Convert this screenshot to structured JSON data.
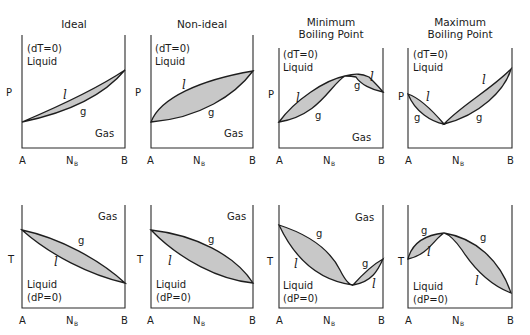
{
  "figure": {
    "caption_top_partial": "",
    "panels": [
      {
        "id": "ideal-p",
        "title": [
          "Ideal"
        ],
        "condition": "(dT=0)",
        "upper_phase": "Liquid",
        "lower_phase": "Gas",
        "y_axis": "P",
        "x_axis": "N",
        "x_axis_sub": "B",
        "x_left": "A",
        "x_right": "B",
        "curve_labels": [
          "l",
          "g"
        ]
      },
      {
        "id": "nonideal-p",
        "title": [
          "Non-ideal"
        ],
        "condition": "(dT=0)",
        "upper_phase": "Liquid",
        "lower_phase": "Gas",
        "y_axis": "P",
        "x_axis": "N",
        "x_axis_sub": "B",
        "x_left": "A",
        "x_right": "B",
        "curve_labels": [
          "l",
          "g"
        ]
      },
      {
        "id": "minbp-p",
        "title": [
          "Minimum",
          "Boiling Point"
        ],
        "condition": "(dT=0)",
        "upper_phase": "Liquid",
        "lower_phase": "Gas",
        "y_axis": "P",
        "x_axis": "N",
        "x_axis_sub": "B",
        "x_left": "A",
        "x_right": "B",
        "curve_labels": [
          "l",
          "g",
          "g",
          "l"
        ]
      },
      {
        "id": "maxbp-p",
        "title": [
          "Maximum",
          "Boiling Point"
        ],
        "condition": "(dT=0)",
        "upper_phase": "Liquid",
        "lower_phase": "",
        "y_axis": "P",
        "x_axis": "N",
        "x_axis_sub": "B",
        "x_left": "A",
        "x_right": "B",
        "curve_labels": [
          "l",
          "g",
          "l",
          "g"
        ]
      },
      {
        "id": "ideal-t",
        "upper_phase": "Gas",
        "lower_phase": "Liquid",
        "condition": "(dP=0)",
        "y_axis": "T",
        "x_axis": "N",
        "x_axis_sub": "B",
        "x_left": "A",
        "x_right": "B",
        "curve_labels": [
          "g",
          "l"
        ]
      },
      {
        "id": "nonideal-t",
        "upper_phase": "Gas",
        "lower_phase": "Liquid",
        "condition": "(dP=0)",
        "y_axis": "T",
        "x_axis": "N",
        "x_axis_sub": "B",
        "x_left": "A",
        "x_right": "B",
        "curve_labels": [
          "g",
          "l"
        ]
      },
      {
        "id": "minbp-t",
        "upper_phase": "Gas",
        "lower_phase": "Liquid",
        "condition": "(dP=0)",
        "y_axis": "T",
        "x_axis": "N",
        "x_axis_sub": "B",
        "x_left": "A",
        "x_right": "B",
        "curve_labels": [
          "g",
          "l",
          "g",
          "l"
        ]
      },
      {
        "id": "maxbp-t",
        "upper_phase": "",
        "lower_phase": "Liquid",
        "condition": "(dP=0)",
        "y_axis": "T",
        "x_axis": "N",
        "x_axis_sub": "B",
        "x_left": "A",
        "x_right": "B",
        "curve_labels": [
          "g",
          "l",
          "g",
          "l"
        ]
      }
    ],
    "colors": {
      "two_phase_fill": "#c8c8c8",
      "line": "#1e1e1e",
      "background": "#ffffff"
    }
  }
}
